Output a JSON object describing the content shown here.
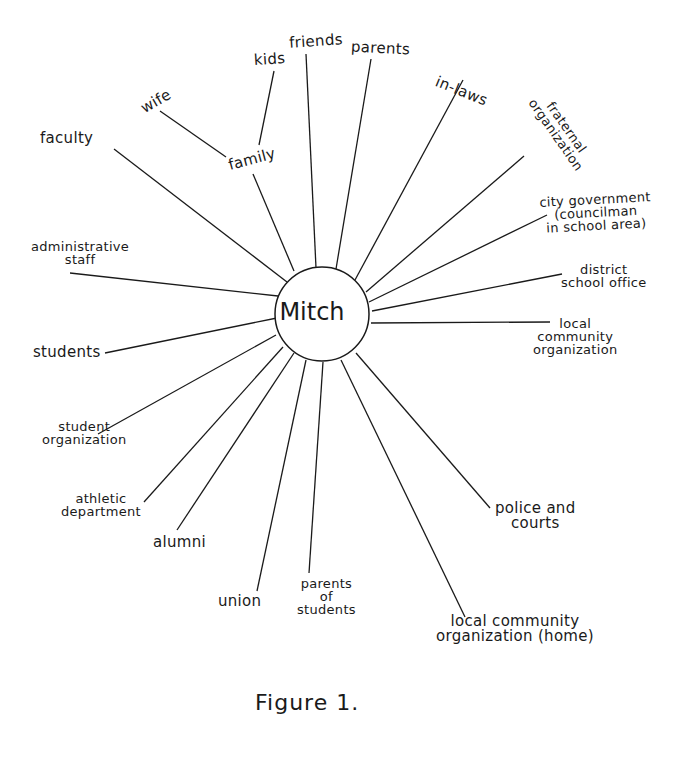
{
  "diagram": {
    "center": {
      "label": "Mitch"
    },
    "nodes": {
      "kids": "kids",
      "friends": "friends",
      "parents": "parents",
      "in_laws": "in-laws",
      "fraternal_organization": "fraternal\norganization",
      "city_government": "city government\n(councilman\nin school area)",
      "district_school_office": "district\nschool office",
      "local_community_organization": "local\ncommunity\norganization",
      "police_and_courts": "police and\ncourts",
      "local_community_organization_home": "local community\norganization (home)",
      "parents_of_students": "parents\nof\nstudents",
      "union": "union",
      "alumni": "alumni",
      "athletic_department": "athletic\ndepartment",
      "student_organization": "student\norganization",
      "students": "students",
      "administrative_staff": "administrative\nstaff",
      "faculty": "faculty",
      "wife": "wife",
      "family": "family"
    },
    "edges": [
      [
        "Mitch",
        "family"
      ],
      [
        "family",
        "wife"
      ],
      [
        "family",
        "kids"
      ],
      [
        "Mitch",
        "friends"
      ],
      [
        "Mitch",
        "parents"
      ],
      [
        "Mitch",
        "in-laws"
      ],
      [
        "Mitch",
        "fraternal organization"
      ],
      [
        "Mitch",
        "city government"
      ],
      [
        "Mitch",
        "district school office"
      ],
      [
        "Mitch",
        "local community organization"
      ],
      [
        "Mitch",
        "police and courts"
      ],
      [
        "Mitch",
        "local community organization (home)"
      ],
      [
        "Mitch",
        "parents of students"
      ],
      [
        "Mitch",
        "union"
      ],
      [
        "Mitch",
        "alumni"
      ],
      [
        "Mitch",
        "athletic department"
      ],
      [
        "Mitch",
        "student organization"
      ],
      [
        "Mitch",
        "students"
      ],
      [
        "Mitch",
        "administrative staff"
      ],
      [
        "Mitch",
        "faculty"
      ]
    ]
  },
  "caption": "Figure 1."
}
